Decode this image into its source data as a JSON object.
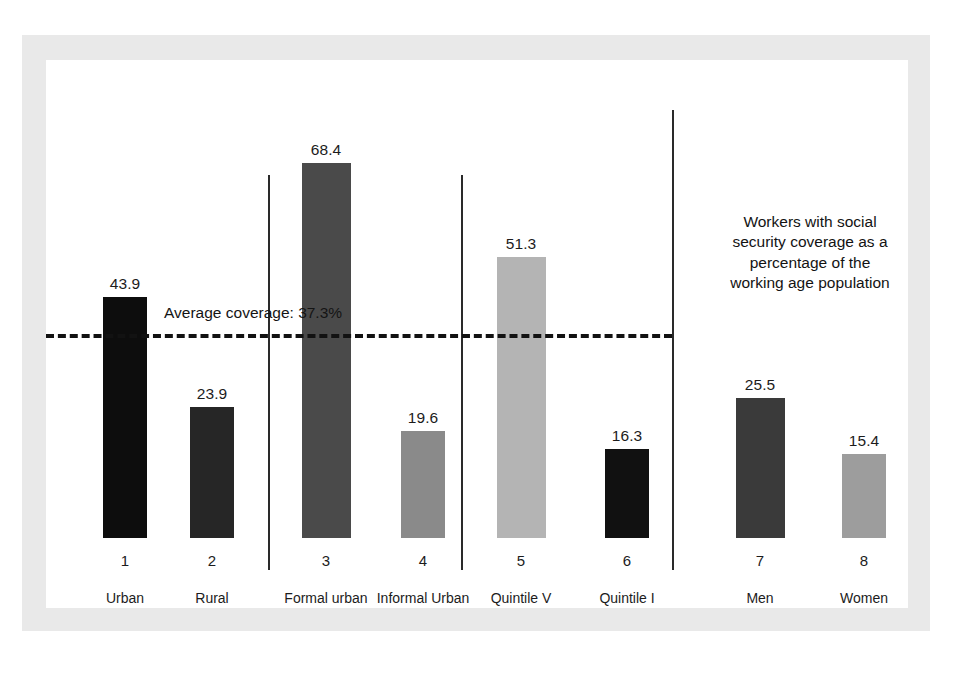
{
  "chart_data": {
    "type": "bar",
    "title": "",
    "subtitle": "",
    "xlabel": "",
    "ylabel": "",
    "ylim": [
      0,
      75
    ],
    "grid": false,
    "legend_position": "none",
    "categories": [
      "Urban",
      "Rural",
      "Formal urban",
      "Informal Urban",
      "Quintile V",
      "Quintile I",
      "Men",
      "Women"
    ],
    "tick_numbers": [
      "1",
      "2",
      "3",
      "4",
      "5",
      "6",
      "7",
      "8"
    ],
    "values": [
      43.9,
      23.9,
      68.4,
      19.6,
      51.3,
      16.3,
      25.5,
      15.4
    ],
    "value_labels": [
      "43.9",
      "23.9",
      "68.4",
      "19.6",
      "51.3",
      "16.3",
      "25.5",
      "15.4"
    ],
    "bar_colors": [
      "#0d0d0d",
      "#262626",
      "#4a4a4a",
      "#8a8a8a",
      "#b4b4b4",
      "#111111",
      "#3a3a3a",
      "#9d9d9d"
    ],
    "reference_line": {
      "label": "Average coverage: 37.3%",
      "value": 37.3,
      "style": "dashed"
    },
    "annotation": {
      "lines": [
        "Workers with social",
        "security coverage as a",
        "percentage of the",
        "working age population"
      ]
    },
    "group_separators": [
      2,
      4,
      6
    ]
  },
  "colors": {
    "frame": "#e9e9e9",
    "background": "#ffffff",
    "text": "#1c1c1c",
    "rule": "#2a2a2a"
  }
}
